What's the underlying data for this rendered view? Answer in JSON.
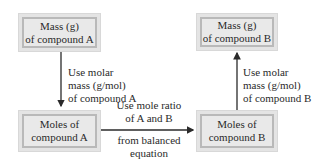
{
  "boxes": {
    "mass_a": {
      "line1": "Mass (g)",
      "line2": "of compound A"
    },
    "moles_a": {
      "line1": "Moles of",
      "line2": "compound A"
    },
    "mass_b": {
      "line1": "Mass (g)",
      "line2": "of compound B"
    },
    "moles_b": {
      "line1": "Moles of",
      "line2": "compound B"
    }
  },
  "edges": {
    "a_down": {
      "line1": "Use molar",
      "line2": "mass (g/mol)",
      "line3": "of compound A"
    },
    "ratio_top": {
      "line1": "Use mole ratio",
      "line2": "of A and B"
    },
    "ratio_bottom": {
      "line1": "from balanced",
      "line2": "equation"
    },
    "b_up": {
      "line1": "Use molar",
      "line2": "mass (g/mol)",
      "line3": "of compound B"
    }
  },
  "colors": {
    "box_fill": "#e9e9e9",
    "box_border": "#b9b9b9",
    "arrow": "#2a2a2a"
  }
}
